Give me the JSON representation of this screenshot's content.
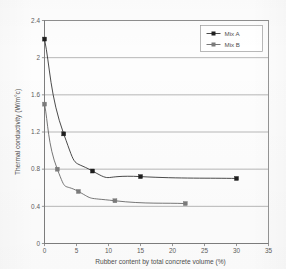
{
  "chart_data": {
    "type": "line",
    "title": "",
    "xlabel": "Rubber content by total concrete volume (%)",
    "ylabel": "Thermal conductivity  (W/m°c)",
    "xlim": [
      0,
      35
    ],
    "ylim": [
      0,
      2.4
    ],
    "xticks": [
      0,
      5,
      10,
      15,
      20,
      25,
      30,
      35
    ],
    "xtick_labels": [
      "0",
      "5",
      "10",
      "15",
      "20",
      "25",
      "30",
      "35"
    ],
    "yticks": [
      0,
      0.4,
      0.8,
      1.2,
      1.6,
      2,
      2.4
    ],
    "ytick_labels": [
      "0",
      "0.4",
      "0.8",
      "1.2",
      "1.6",
      "2",
      "2.4"
    ],
    "grid": "horizontal",
    "legend_position": "top-right",
    "marker": "square",
    "series": [
      {
        "name": "Mix A",
        "color": "#2b2b2b",
        "marker_color": "#1e1e1e",
        "x": [
          0,
          3,
          7.5,
          15,
          30
        ],
        "y": [
          2.2,
          1.18,
          0.78,
          0.72,
          0.7
        ]
      },
      {
        "name": "Mix B",
        "color": "#5f5f5f",
        "marker_color": "#7b7b7b",
        "x": [
          0,
          2,
          5.3,
          11,
          22
        ],
        "y": [
          1.5,
          0.8,
          0.56,
          0.46,
          0.43
        ]
      }
    ]
  },
  "legend": {
    "entries": [
      {
        "label": "Mix A"
      },
      {
        "label": "Mix B"
      }
    ]
  },
  "axes": {
    "x_title": "Rubber content by total concrete volume (%)",
    "y_title": "Thermal conductivity  (W/m°c)"
  }
}
